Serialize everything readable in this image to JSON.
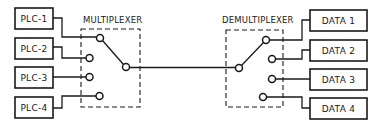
{
  "diagram": {
    "multiplexer": {
      "label": "MULTIPLEXER",
      "inputs": [
        {
          "label": "PLC-1"
        },
        {
          "label": "PLC-2"
        },
        {
          "label": "PLC-3"
        },
        {
          "label": "PLC-4"
        }
      ],
      "selected_input": "PLC-1"
    },
    "demultiplexer": {
      "label": "DEMULTIPLEXER",
      "outputs": [
        {
          "label": "DATA 1"
        },
        {
          "label": "DATA 2"
        },
        {
          "label": "DATA 3"
        },
        {
          "label": "DATA 4"
        }
      ],
      "selected_output": "DATA 1"
    },
    "colors": {
      "stroke": "#1a1a1a",
      "background": "#ffffff"
    }
  }
}
